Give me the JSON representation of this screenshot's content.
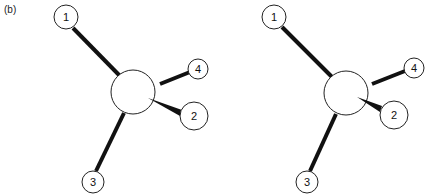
{
  "panel_label": "(b)",
  "colors": {
    "line": "#111111",
    "atom_fill": "#ffffff",
    "background": "#ffffff"
  },
  "diagrams": [
    {
      "name": "left-molecule",
      "center": {
        "x": 133,
        "y": 92,
        "r": 22
      },
      "atoms": [
        {
          "label": "1",
          "x": 66,
          "y": 17,
          "r": 12
        },
        {
          "label": "2",
          "x": 194,
          "y": 116,
          "r": 14
        },
        {
          "label": "3",
          "x": 93,
          "y": 182,
          "r": 11
        },
        {
          "label": "4",
          "x": 198,
          "y": 69,
          "r": 10
        }
      ]
    },
    {
      "name": "right-molecule",
      "center": {
        "x": 346,
        "y": 93,
        "r": 22
      },
      "atoms": [
        {
          "label": "1",
          "x": 274,
          "y": 17,
          "r": 12
        },
        {
          "label": "2",
          "x": 394,
          "y": 115,
          "r": 14
        },
        {
          "label": "3",
          "x": 307,
          "y": 182,
          "r": 11
        },
        {
          "label": "4",
          "x": 414,
          "y": 68,
          "r": 10
        }
      ]
    }
  ]
}
